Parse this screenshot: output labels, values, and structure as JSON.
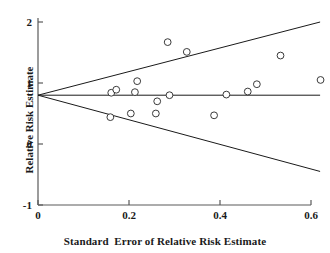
{
  "chart_data": {
    "type": "scatter",
    "title": "",
    "xlabel": "Standard  Error of Relative Risk Estimate",
    "ylabel": "Relative Risk Estimate",
    "xlim": [
      0,
      0.62
    ],
    "ylim": [
      -1,
      2
    ],
    "xticks": [
      0,
      0.2,
      0.4,
      0.6
    ],
    "xtick_labels": [
      "0",
      "0.2",
      "0.4",
      "0.6"
    ],
    "yticks": [
      -1,
      0,
      1,
      2
    ],
    "ytick_labels": [
      "-1",
      "0",
      "1",
      "2"
    ],
    "grid": false,
    "legend": "none",
    "pooled_estimate": 0.8,
    "reference_line": {
      "name": "pooled-effect-line",
      "y": 0.8,
      "x_start": 0,
      "x_end": 0.62
    },
    "funnel_bounds": [
      {
        "name": "upper-pseudo-confidence-limit",
        "points": [
          [
            0,
            0.8
          ],
          [
            0.62,
            2.0
          ]
        ]
      },
      {
        "name": "lower-pseudo-confidence-limit",
        "points": [
          [
            0,
            0.8
          ],
          [
            0.62,
            -0.45
          ]
        ]
      }
    ],
    "series": [
      {
        "name": "Studies",
        "marker": "open-circle",
        "points": [
          {
            "x": 0.159,
            "y": 0.44
          },
          {
            "x": 0.161,
            "y": 0.84
          },
          {
            "x": 0.172,
            "y": 0.89
          },
          {
            "x": 0.204,
            "y": 0.5
          },
          {
            "x": 0.213,
            "y": 0.85
          },
          {
            "x": 0.218,
            "y": 1.03
          },
          {
            "x": 0.259,
            "y": 0.5
          },
          {
            "x": 0.262,
            "y": 0.7
          },
          {
            "x": 0.285,
            "y": 1.67
          },
          {
            "x": 0.289,
            "y": 0.8
          },
          {
            "x": 0.327,
            "y": 1.51
          },
          {
            "x": 0.387,
            "y": 0.47
          },
          {
            "x": 0.414,
            "y": 0.81
          },
          {
            "x": 0.461,
            "y": 0.86
          },
          {
            "x": 0.481,
            "y": 0.98
          },
          {
            "x": 0.533,
            "y": 1.45
          },
          {
            "x": 0.621,
            "y": 1.05
          }
        ]
      }
    ]
  },
  "axes": {
    "x_title": "Standard  Error of Relative Risk Estimate",
    "y_title": "Relative Risk Estimate"
  },
  "style": {
    "axis_color": "#5a5a5a",
    "line_color": "#1a1a1a",
    "marker_edge_color": "#3a3a3a",
    "marker_fill": "#ffffff",
    "background": "#ffffff"
  }
}
